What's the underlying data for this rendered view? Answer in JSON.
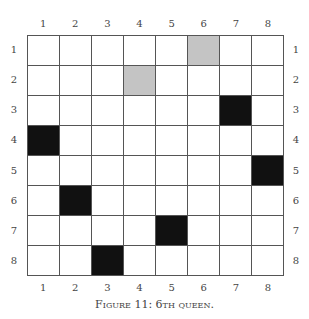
{
  "figure": {
    "caption": "Figure 11: 6th queen.",
    "rows": 8,
    "cols": 8,
    "col_labels": [
      "1",
      "2",
      "3",
      "4",
      "5",
      "6",
      "7",
      "8"
    ],
    "row_labels": [
      "1",
      "2",
      "3",
      "4",
      "5",
      "6",
      "7",
      "8"
    ],
    "queens": [
      {
        "row": 3,
        "col": 7
      },
      {
        "row": 4,
        "col": 1
      },
      {
        "row": 5,
        "col": 8
      },
      {
        "row": 6,
        "col": 2
      },
      {
        "row": 7,
        "col": 5
      },
      {
        "row": 8,
        "col": 3
      }
    ],
    "shaded": [
      {
        "row": 1,
        "col": 6
      },
      {
        "row": 2,
        "col": 4
      }
    ],
    "colors": {
      "queen": "#111111",
      "shaded": "#c4c4c4",
      "grid": "#555555"
    }
  }
}
